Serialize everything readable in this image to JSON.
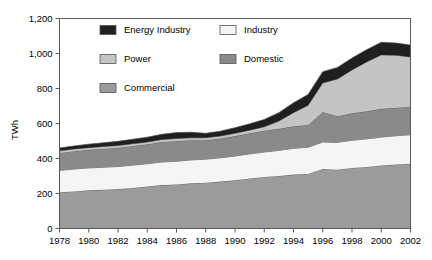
{
  "chart_data": {
    "type": "area",
    "stacked": true,
    "title": "",
    "xlabel": "",
    "ylabel": "TWh",
    "ylim": [
      0,
      1200
    ],
    "xlim": [
      1978,
      2002
    ],
    "yticks": [
      "0",
      "200",
      "400",
      "600",
      "800",
      "1,000",
      "1,200"
    ],
    "ytick_values": [
      0,
      200,
      400,
      600,
      800,
      1000,
      1200
    ],
    "xticks": [
      "1978",
      "1980",
      "1982",
      "1984",
      "1986",
      "1988",
      "1990",
      "1992",
      "1994",
      "1996",
      "1998",
      "2000",
      "2002"
    ],
    "xtick_values": [
      1978,
      1980,
      1982,
      1984,
      1986,
      1988,
      1990,
      1992,
      1994,
      1996,
      1998,
      2000,
      2002
    ],
    "grid": false,
    "legend_position": "upper-center-inside",
    "x": [
      1978,
      1979,
      1980,
      1981,
      1982,
      1983,
      1984,
      1985,
      1986,
      1987,
      1988,
      1989,
      1990,
      1991,
      1992,
      1993,
      1994,
      1995,
      1996,
      1997,
      1998,
      1999,
      2000,
      2001,
      2002
    ],
    "stack_order_bottom_to_top": [
      "Commercial",
      "Industry",
      "Domestic",
      "Power",
      "Energy Industry"
    ],
    "series": [
      {
        "name": "Commercial",
        "color": "#9b9b9b",
        "values": [
          207,
          212,
          218,
          222,
          226,
          232,
          240,
          248,
          252,
          258,
          262,
          268,
          276,
          286,
          295,
          300,
          308,
          312,
          340,
          336,
          346,
          352,
          360,
          366,
          370
        ]
      },
      {
        "name": "Industry",
        "color": "#f5f5f5",
        "values": [
          125,
          128,
          128,
          128,
          128,
          130,
          130,
          132,
          132,
          134,
          134,
          136,
          138,
          140,
          142,
          146,
          150,
          152,
          154,
          156,
          158,
          160,
          162,
          164,
          166
        ]
      },
      {
        "name": "Domestic",
        "color": "#8a8a8a",
        "values": [
          100,
          102,
          104,
          106,
          108,
          110,
          112,
          114,
          116,
          112,
          108,
          110,
          114,
          118,
          122,
          124,
          126,
          128,
          172,
          150,
          154,
          158,
          162,
          160,
          158
        ]
      },
      {
        "name": "Power",
        "color": "#c4c4c4",
        "values": [
          12,
          12,
          12,
          12,
          12,
          12,
          12,
          14,
          14,
          14,
          14,
          14,
          16,
          18,
          22,
          44,
          78,
          112,
          166,
          212,
          248,
          282,
          308,
          300,
          286
        ]
      },
      {
        "name": "Energy Industry",
        "color": "#1f1f1f",
        "values": [
          16,
          18,
          20,
          22,
          24,
          26,
          28,
          30,
          34,
          32,
          26,
          28,
          32,
          36,
          42,
          48,
          56,
          62,
          64,
          66,
          68,
          70,
          72,
          70,
          68
        ]
      }
    ],
    "totals": [
      460,
      472,
      482,
      490,
      498,
      510,
      522,
      538,
      548,
      550,
      544,
      556,
      576,
      598,
      623,
      662,
      718,
      766,
      896,
      920,
      974,
      1022,
      1064,
      1060,
      1048
    ]
  },
  "legend": {
    "items": [
      {
        "label": "Energy Industry",
        "color": "#1f1f1f"
      },
      {
        "label": "Industry",
        "color": "#f5f5f5"
      },
      {
        "label": "Power",
        "color": "#c4c4c4"
      },
      {
        "label": "Domestic",
        "color": "#8a8a8a"
      },
      {
        "label": "Commercial",
        "color": "#9b9b9b"
      }
    ]
  },
  "axis": {
    "ylabel": "TWh"
  }
}
